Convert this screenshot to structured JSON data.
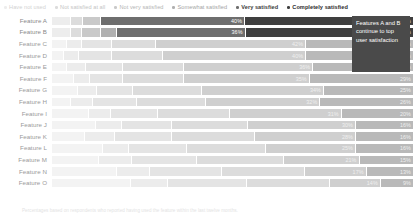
{
  "legend": {
    "items": [
      {
        "label": "Have not used",
        "color": "#ededed",
        "tone": "faint"
      },
      {
        "label": "Not satisfied at all",
        "color": "#dcdcdc",
        "tone": "l2"
      },
      {
        "label": "Not very satisfied",
        "color": "#c9c9c9",
        "tone": "l3"
      },
      {
        "label": "Somewhat satisfied",
        "color": "#b0b0b0",
        "tone": "l4"
      },
      {
        "label": "Very satisfied",
        "color": "#6e6e6e",
        "tone": "strong"
      },
      {
        "label": "Completely satisfied",
        "color": "#3f3f3f",
        "tone": "strong2"
      }
    ]
  },
  "annotation": {
    "text": "Features A and B continue to top user satisfaction",
    "background": "#4a4a4a",
    "color": "#ffffff"
  },
  "footnote": {
    "text": "Percentages based on respondents who reported having used the feature within the last twelve months."
  },
  "chart_data": {
    "type": "bar",
    "subtype": "stacked-likert",
    "title": "",
    "xlabel": "",
    "ylabel": "",
    "xlim": [
      0,
      100
    ],
    "grid": false,
    "legend_position": "top",
    "categories": [
      "Feature A",
      "Feature B",
      "Feature C",
      "Feature D",
      "Feature E",
      "Feature F",
      "Feature G",
      "Feature H",
      "Feature I",
      "Feature J",
      "Feature K",
      "Feature L",
      "Feature M",
      "Feature N",
      "Feature O"
    ],
    "series": [
      {
        "name": "Have not used",
        "color": "#ededed",
        "values": [
          5,
          5,
          4,
          3,
          4,
          6,
          7,
          5,
          10,
          12,
          9,
          14,
          13,
          18,
          22
        ]
      },
      {
        "name": "Not satisfied at all",
        "color": "#dcdcdc",
        "values": [
          3,
          3,
          4,
          4,
          5,
          4,
          5,
          6,
          6,
          7,
          8,
          7,
          9,
          9,
          10
        ]
      },
      {
        "name": "Not very satisfied",
        "color": "#c9c9c9",
        "values": [
          5,
          5,
          8,
          9,
          10,
          9,
          10,
          12,
          13,
          14,
          16,
          16,
          18,
          20,
          22
        ]
      },
      {
        "name": "Somewhat satisfied",
        "color": "#b0b0b0",
        "values": [
          0,
          4,
          12,
          14,
          17,
          17,
          19,
          19,
          20,
          21,
          23,
          22,
          24,
          23,
          23
        ]
      },
      {
        "name": "Very satisfied",
        "color": "#6e6e6e",
        "values": [
          40,
          36,
          42,
          40,
          36,
          35,
          34,
          32,
          31,
          30,
          28,
          25,
          21,
          17,
          14
        ]
      },
      {
        "name": "Completely satisfied",
        "color": "#3f3f3f",
        "values": [
          47,
          47,
          30,
          30,
          28,
          29,
          25,
          26,
          20,
          16,
          16,
          16,
          15,
          13,
          9
        ]
      }
    ],
    "value_labels": [
      {
        "category": "Feature A",
        "labels": [
          "",
          "",
          "",
          "",
          "40%",
          "47%"
        ]
      },
      {
        "category": "Feature B",
        "labels": [
          "",
          "",
          "",
          "",
          "36%",
          "47%"
        ]
      },
      {
        "category": "Feature C",
        "labels": [
          "",
          "",
          "",
          "",
          "42%",
          "30%"
        ]
      },
      {
        "category": "Feature D",
        "labels": [
          "",
          "",
          "",
          "",
          "40%",
          "30%"
        ]
      },
      {
        "category": "Feature E",
        "labels": [
          "",
          "",
          "",
          "",
          "36%",
          "28%"
        ]
      },
      {
        "category": "Feature F",
        "labels": [
          "",
          "",
          "",
          "",
          "35%",
          "29%"
        ]
      },
      {
        "category": "Feature G",
        "labels": [
          "",
          "",
          "",
          "",
          "34%",
          "25%"
        ]
      },
      {
        "category": "Feature H",
        "labels": [
          "",
          "",
          "",
          "",
          "32%",
          "26%"
        ]
      },
      {
        "category": "Feature I",
        "labels": [
          "",
          "",
          "",
          "",
          "31%",
          "20%"
        ]
      },
      {
        "category": "Feature J",
        "labels": [
          "",
          "",
          "",
          "",
          "30%",
          "16%"
        ]
      },
      {
        "category": "Feature K",
        "labels": [
          "",
          "",
          "",
          "",
          "28%",
          "16%"
        ]
      },
      {
        "category": "Feature L",
        "labels": [
          "",
          "",
          "",
          "",
          "25%",
          "16%"
        ]
      },
      {
        "category": "Feature M",
        "labels": [
          "",
          "",
          "",
          "",
          "21%",
          "15%"
        ]
      },
      {
        "category": "Feature N",
        "labels": [
          "",
          "",
          "",
          "",
          "17%",
          "13%"
        ]
      },
      {
        "category": "Feature O",
        "labels": [
          "",
          "",
          "",
          "",
          "14%",
          "9%"
        ]
      }
    ],
    "highlight_rows": [
      "Feature A",
      "Feature B"
    ]
  }
}
